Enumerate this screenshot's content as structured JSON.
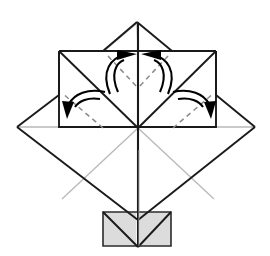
{
  "figure": {
    "type": "diagram",
    "canvas": {
      "width": 270,
      "height": 256
    },
    "background_color": "#ffffff"
  },
  "palette": {
    "outline": "#1a1a1a",
    "outline_soft": "#3a3a3a",
    "crease_light": "#b5b5b5",
    "crease_mid": "#8c8c8c",
    "dashed_fold": "#8a8a8a",
    "shaded_fill": "#dcdcdc",
    "shaded_stroke": "#2b2b2b",
    "paper_fill": "#ffffff",
    "arrow": "#000000"
  },
  "geometry": {
    "center": {
      "x": 138,
      "y": 128
    },
    "diamond": {
      "label": "base square rotated 45 degrees",
      "top": {
        "x": 138,
        "y": 36
      },
      "right": {
        "x": 255,
        "y": 127
      },
      "bottom": {
        "x": 138,
        "y": 220
      },
      "left": {
        "x": 17,
        "y": 127
      }
    },
    "upper_rectangle": {
      "label": "upper folded flap panel",
      "top_left": {
        "x": 59,
        "y": 51
      },
      "top_right": {
        "x": 216,
        "y": 51
      },
      "bottom_right": {
        "x": 216,
        "y": 127
      },
      "bottom_left": {
        "x": 59,
        "y": 127
      }
    },
    "peak_triangle": {
      "label": "small top point",
      "apex": {
        "x": 137,
        "y": 22
      },
      "left": {
        "x": 103,
        "y": 51
      },
      "right": {
        "x": 172,
        "y": 51
      }
    },
    "shaded_panel": {
      "label": "gray underside flaps at bottom",
      "left": {
        "x": 103,
        "y": 212
      },
      "right": {
        "x": 171,
        "y": 212
      },
      "bottom_right": {
        "x": 171,
        "y": 246
      },
      "bottom_left": {
        "x": 103,
        "y": 246
      },
      "notch_apex": {
        "x": 138,
        "y": 220
      }
    }
  },
  "creases": [
    {
      "name": "vertical-center-crease",
      "style": "solid",
      "from": [
        138,
        22
      ],
      "to": [
        138,
        246
      ]
    },
    {
      "name": "diagonal-crease-nw",
      "style": "solid",
      "from": [
        59,
        51
      ],
      "to": [
        138,
        128
      ]
    },
    {
      "name": "diagonal-crease-ne",
      "style": "solid",
      "from": [
        216,
        51
      ],
      "to": [
        138,
        128
      ]
    },
    {
      "name": "diagonal-crease-sw",
      "style": "light",
      "from": [
        138,
        128
      ],
      "to": [
        62,
        199
      ]
    },
    {
      "name": "diagonal-crease-se",
      "style": "light",
      "from": [
        138,
        128
      ],
      "to": [
        214,
        199
      ]
    },
    {
      "name": "horizontal-crease-left",
      "style": "light",
      "from": [
        17,
        127
      ],
      "to": [
        59,
        127
      ]
    },
    {
      "name": "horizontal-crease-right",
      "style": "light",
      "from": [
        216,
        127
      ],
      "to": [
        255,
        127
      ]
    },
    {
      "name": "peak-crease-left",
      "style": "light",
      "from": [
        137,
        22
      ],
      "to": [
        103,
        51
      ]
    },
    {
      "name": "peak-crease-vertical",
      "style": "light",
      "from": [
        137,
        22
      ],
      "to": [
        138,
        51
      ]
    }
  ],
  "fold_lines": [
    {
      "name": "dashed-fold-top-left",
      "style": "dashed",
      "from": [
        108,
        56
      ],
      "to": [
        138,
        88
      ]
    },
    {
      "name": "dashed-fold-top-right",
      "style": "dashed",
      "from": [
        168,
        56
      ],
      "to": [
        138,
        88
      ]
    },
    {
      "name": "dashed-fold-mid-left",
      "style": "dashed",
      "from": [
        103,
        128
      ],
      "to": [
        62,
        93
      ]
    },
    {
      "name": "dashed-fold-mid-right",
      "style": "dashed",
      "from": [
        173,
        128
      ],
      "to": [
        214,
        93
      ]
    }
  ],
  "arrows": [
    {
      "name": "fold-arrow-top-left",
      "description": "curved arrow sweeping up-right toward top center",
      "path": "M 108 92 C 104 66 120 56 131 54",
      "tip": {
        "x": 131,
        "y": 54
      },
      "direction_deg": -14
    },
    {
      "name": "fold-arrow-top-right",
      "description": "curved arrow sweeping up-left toward top center",
      "path": "M 170 92 C 174 66 158 56 147 54",
      "tip": {
        "x": 147,
        "y": 54
      },
      "direction_deg": 194
    },
    {
      "name": "fold-arrow-left",
      "description": "curved arrow sweeping down-left to outer flap",
      "path": "M 103 92 C 86 88 72 96 68 108",
      "tip": {
        "x": 68,
        "y": 110
      },
      "direction_deg": 104
    },
    {
      "name": "fold-arrow-right",
      "description": "curved arrow sweeping down-right to outer flap",
      "path": "M 175 92 C 192 88 206 96 210 108",
      "tip": {
        "x": 210,
        "y": 110
      },
      "direction_deg": 76
    }
  ]
}
